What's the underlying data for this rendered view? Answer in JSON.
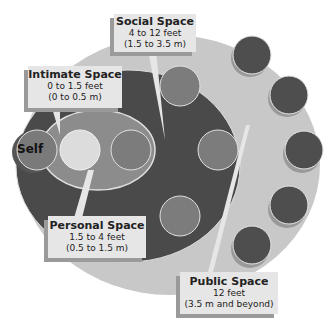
{
  "diagram": {
    "colors": {
      "public_zone": "#c8c8c8",
      "social_zone": "#4a4a4a",
      "personal_zone": "#8c8c8c",
      "intimate_circle": "#dcdcdc",
      "self_circle": "#7a7a7a",
      "person_medium": "#7c7c7c",
      "person_dark": "#4e4e4e",
      "label_bg": "#e6e6e6",
      "label_shadow": "#9a9a9a"
    },
    "self": {
      "label": "Self"
    },
    "zones": [
      {
        "id": "intimate",
        "title": "Intimate Space",
        "feet": "0 to 1.5 feet",
        "meters": "(0 to 0.5 m)"
      },
      {
        "id": "personal",
        "title": "Personal Space",
        "feet": "1.5 to 4 feet",
        "meters": "(0.5  to 1.5 m)"
      },
      {
        "id": "social",
        "title": "Social Space",
        "feet": "4 to 12 feet",
        "meters": "(1.5 to 3.5 m)"
      },
      {
        "id": "public",
        "title": "Public Space",
        "feet": "12 feet",
        "meters": "(3.5 m and beyond)"
      }
    ]
  }
}
